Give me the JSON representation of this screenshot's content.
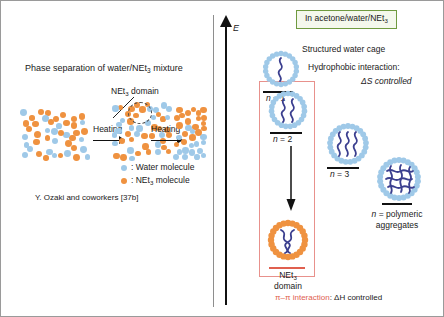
{
  "figure": {
    "left_panel": {
      "title": "Phase separation of water/NEt3 mixture",
      "title_parts": {
        "pre": "Phase separation of water/NEt",
        "sub": "3",
        "post": " mixture"
      },
      "domain_callout": {
        "pre": "NEt",
        "sub": "3",
        "post": " domain"
      },
      "arrow1_label": "Heating",
      "arrow2_label": "Heating",
      "legend": [
        {
          "color": "#9fc9e8",
          "label": ": Water molecule",
          "name": "water-molecule"
        },
        {
          "color": "#ef9240",
          "label_pre": ": NEt",
          "label_sub": "3",
          "label_post": " molecule",
          "name": "net3-molecule"
        }
      ],
      "credit": "Y. Ozaki and coworkers [37b]"
    },
    "right_panel": {
      "axis_label": "E",
      "condition_box": {
        "pre": "In acetone/water/NEt",
        "sub": "3",
        "post": ""
      },
      "structured_water_cage": "Structured water cage",
      "hydrophobic_interaction": "Hydrophobic interaction:",
      "ds_controlled": "ΔS controlled",
      "states": [
        {
          "name": "n-1",
          "label_pre": "n",
          "label_post": " = 1",
          "chains": 1
        },
        {
          "name": "n-2",
          "label_pre": "n",
          "label_post": " = 2",
          "chains": 2
        },
        {
          "name": "n-3",
          "label_pre": "n",
          "label_post": " = 3",
          "chains": 3
        },
        {
          "name": "n-polymeric",
          "label_pre": "n",
          "label_post": " = polymeric",
          "label_line2": "aggregates",
          "chains": 8
        }
      ],
      "net3_domain": {
        "pre": "NEt",
        "sub": "3",
        "post": "",
        "line2": "domain"
      },
      "pipi_note": {
        "highlight": "π–π interaction",
        "rest": ": ΔH controlled"
      }
    },
    "colors": {
      "water": "#9fc9e8",
      "net3": "#ef9240",
      "chain": "#3b3f8f",
      "green_border": "#6f9a3f",
      "green_fill": "#f4f8ec",
      "pink_border": "#e8918c",
      "red_rule": "#e0604f",
      "divider": "#8e8e8e"
    }
  }
}
